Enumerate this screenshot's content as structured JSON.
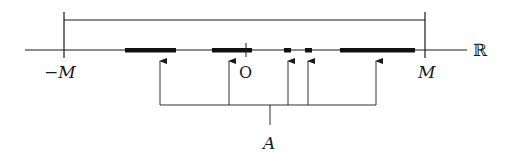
{
  "diagram": {
    "type": "number-line-set-diagram",
    "axis": {
      "label": "ℝ",
      "x_start": 25,
      "x_end": 467,
      "y": 50
    },
    "bound_bracket": {
      "y": 20,
      "left": {
        "x": 64,
        "label": "−M"
      },
      "right": {
        "x": 425,
        "label": "M"
      }
    },
    "origin": {
      "x": 246,
      "label": "O"
    },
    "segments": [
      {
        "x1": 125,
        "x2": 176
      },
      {
        "x1": 212,
        "x2": 252
      },
      {
        "x1": 284,
        "x2": 291
      },
      {
        "x1": 305,
        "x2": 312
      },
      {
        "x1": 340,
        "x2": 415
      }
    ],
    "arrows_x": [
      160,
      229,
      288,
      308,
      376
    ],
    "set_bracket": {
      "y": 105,
      "x1": 160,
      "x2": 376,
      "stem_x": 268,
      "label": "A"
    },
    "colors": {
      "line": "#1a1a1a",
      "segment": "#111111"
    }
  }
}
